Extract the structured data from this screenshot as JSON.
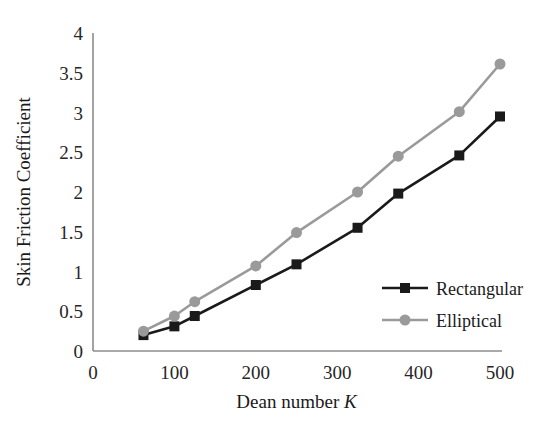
{
  "chart_data": {
    "type": "line",
    "title": "",
    "xlabel": "Dean number K",
    "xlabel_plain": "Dean number",
    "xlabel_italic": "K",
    "ylabel": "Skin Friction Coefficient",
    "xlim": [
      0,
      500
    ],
    "ylim": [
      0,
      4
    ],
    "xticks": [
      0,
      100,
      200,
      300,
      400,
      500
    ],
    "xtick_labels": [
      "0",
      "100",
      "200",
      "300",
      "400",
      "500"
    ],
    "yticks": [
      0,
      0.5,
      1,
      1.5,
      2,
      2.5,
      3,
      3.5,
      4
    ],
    "ytick_labels": [
      "0",
      "0.5",
      "1",
      "1.5",
      "2",
      "2.5",
      "3",
      "3.5",
      "4"
    ],
    "grid": false,
    "legend_position": "lower-right-inside",
    "series": [
      {
        "name": "Rectangular",
        "color": "#1a1a1a",
        "marker": "square",
        "x": [
          62,
          100,
          125,
          200,
          250,
          325,
          375,
          450,
          500
        ],
        "values": [
          0.2,
          0.31,
          0.44,
          0.83,
          1.09,
          1.55,
          1.98,
          2.46,
          2.95
        ]
      },
      {
        "name": "Elliptical",
        "color": "#9a9a9a",
        "marker": "circle",
        "x": [
          62,
          100,
          125,
          200,
          250,
          325,
          375,
          450,
          500
        ],
        "values": [
          0.25,
          0.44,
          0.62,
          1.07,
          1.49,
          2.0,
          2.45,
          3.01,
          3.61
        ]
      }
    ]
  },
  "legend": {
    "items": [
      {
        "label": "Rectangular",
        "color": "#1a1a1a",
        "marker": "square"
      },
      {
        "label": "Elliptical",
        "color": "#9a9a9a",
        "marker": "circle"
      }
    ]
  },
  "axes": {
    "axis_line_color": "#8c8c8c"
  }
}
